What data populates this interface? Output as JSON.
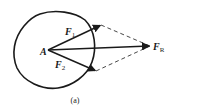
{
  "diagram": {
    "type": "force-parallelogram",
    "caption": "(a)",
    "point": {
      "label": "A"
    },
    "forces": [
      {
        "name": "F1",
        "base": "F",
        "subscript": "1"
      },
      {
        "name": "F2",
        "base": "F",
        "subscript": "2"
      },
      {
        "name": "FR",
        "base": "F",
        "subscript": "R"
      }
    ],
    "colors": {
      "stroke": "#1a1a1a",
      "background": "#ffffff"
    }
  }
}
